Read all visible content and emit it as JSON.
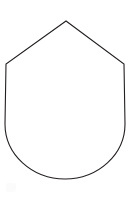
{
  "canvas": {
    "width": 131,
    "height": 202,
    "background_color": "#ffffff",
    "title": "Shield Outline"
  },
  "figure": {
    "name": "shield",
    "fill_color": "#ffffff",
    "stroke_color": "#231f20",
    "stroke_width": 1.1,
    "geometry": {
      "apex": [
        66,
        21
      ],
      "left_shoulder": [
        6,
        64
      ],
      "right_shoulder": [
        124,
        64
      ],
      "left_side_bottom": [
        5,
        124
      ],
      "right_side_bottom": [
        125,
        124
      ],
      "arc_bottom": [
        65,
        178
      ],
      "arc_radius_x": 60,
      "arc_radius_y": 55
    },
    "path": "M 66 21 L 6 64 L 5 124 A 60 55 0 0 0 125 124 L 124 64 Z"
  },
  "artifacts": [
    {
      "name": "faint-smudge",
      "position": [
        6,
        183
      ],
      "size": [
        10,
        9
      ],
      "color": "#fbfbfb"
    }
  ]
}
